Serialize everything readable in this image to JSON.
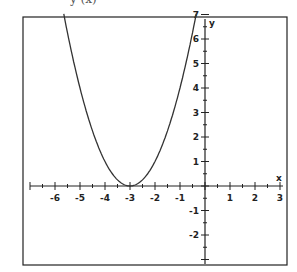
{
  "chart_data": {
    "type": "line",
    "partial_title_visible": "y (x)",
    "xlabel": "x",
    "ylabel": "y",
    "xlim": [
      -7,
      3.3
    ],
    "ylim": [
      -3,
      7
    ],
    "x_ticks": [
      -6,
      -5,
      -4,
      -3,
      -2,
      -1,
      1,
      2,
      3
    ],
    "y_ticks": [
      -2,
      -1,
      1,
      2,
      3,
      4,
      5,
      6,
      7
    ],
    "minor_ticks_per_unit": 2,
    "grid": false,
    "legend": null,
    "series": [
      {
        "name": "parabola",
        "equation": "y = (x + 3)^2",
        "vertex": [
          -3,
          0
        ],
        "x": [
          -5.65,
          -5.5,
          -5,
          -4.5,
          -4,
          -3.5,
          -3,
          -2.5,
          -2,
          -1.5,
          -1,
          -0.5,
          -0.35
        ],
        "y": [
          7.0,
          6.25,
          4,
          2.25,
          1,
          0.25,
          0,
          0.25,
          1,
          2.25,
          4,
          6.25,
          7.0
        ]
      }
    ]
  },
  "frame": {
    "color": "#222222"
  },
  "curve": {
    "color": "#333333"
  }
}
